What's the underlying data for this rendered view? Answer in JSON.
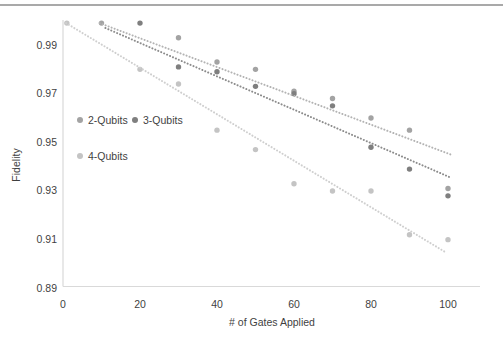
{
  "page": {
    "top_border_color": "#a9a9a9",
    "background_color": "#ffffff",
    "text_color": "#3f3f3f",
    "axis_line_color": "#d9d9d9"
  },
  "chart_data": {
    "type": "scatter",
    "title": "",
    "xlabel": "# of Gates Applied",
    "ylabel": "Fidelity",
    "xlim": [
      0,
      109
    ],
    "ylim": [
      0.888,
      1.0
    ],
    "x_ticks": [
      0,
      20,
      40,
      60,
      80,
      100
    ],
    "y_ticks": [
      0.99,
      0.97,
      0.95,
      0.93,
      0.91,
      0.89
    ],
    "grid": false,
    "legend_position": "inside-top-left",
    "series": [
      {
        "name": "2-Qubits",
        "color": "#a3a3a3",
        "line_color": "#b3b3b3",
        "points": [
          [
            10,
            0.999
          ],
          [
            30,
            0.993
          ],
          [
            40,
            0.983
          ],
          [
            50,
            0.98
          ],
          [
            60,
            0.971
          ],
          [
            70,
            0.968
          ],
          [
            80,
            0.96
          ],
          [
            90,
            0.955
          ],
          [
            100,
            0.931
          ]
        ],
        "trendline": {
          "x1": 9.5,
          "y1": 0.999,
          "x2": 100.7,
          "y2": 0.945
        }
      },
      {
        "name": "3-Qubits",
        "color": "#7f7f7f",
        "line_color": "#8c8c8c",
        "points": [
          [
            20,
            0.999
          ],
          [
            30,
            0.981
          ],
          [
            40,
            0.979
          ],
          [
            50,
            0.973
          ],
          [
            60,
            0.97
          ],
          [
            70,
            0.965
          ],
          [
            80,
            0.948
          ],
          [
            90,
            0.939
          ],
          [
            100,
            0.928
          ]
        ],
        "trendline": {
          "x1": 11,
          "y1": 0.997,
          "x2": 100.7,
          "y2": 0.9355
        }
      },
      {
        "name": "4-Qubits",
        "color": "#c4c4c4",
        "line_color": "#cfcfcf",
        "points": [
          [
            1,
            0.999
          ],
          [
            20,
            0.98
          ],
          [
            30,
            0.974
          ],
          [
            40,
            0.955
          ],
          [
            50,
            0.947
          ],
          [
            60,
            0.933
          ],
          [
            70,
            0.93
          ],
          [
            80,
            0.93
          ],
          [
            90,
            0.912
          ],
          [
            100,
            0.91
          ]
        ],
        "trendline": {
          "x1": 0.8,
          "y1": 0.999,
          "x2": 99.5,
          "y2": 0.9047
        }
      }
    ]
  }
}
